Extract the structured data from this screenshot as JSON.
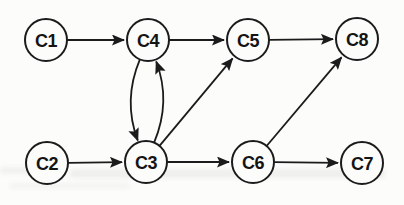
{
  "figure": {
    "background": "#fcfcfb",
    "ink_color": "#1b1b1b",
    "label_color": "#141414",
    "artifact_color": "#e4e4e2"
  },
  "diagram": {
    "node_radius": 21,
    "node_stroke_width": 2,
    "edge_stroke_width": 1.8,
    "nodes": [
      {
        "id": "C1",
        "label": "C1",
        "x": 46,
        "y": 40
      },
      {
        "id": "C4",
        "label": "C4",
        "x": 148,
        "y": 40
      },
      {
        "id": "C5",
        "label": "C5",
        "x": 248,
        "y": 40
      },
      {
        "id": "C8",
        "label": "C8",
        "x": 357,
        "y": 39
      },
      {
        "id": "C2",
        "label": "C2",
        "x": 47,
        "y": 163
      },
      {
        "id": "C3",
        "label": "C3",
        "x": 146,
        "y": 162
      },
      {
        "id": "C6",
        "label": "C6",
        "x": 253,
        "y": 162
      },
      {
        "id": "C7",
        "label": "C7",
        "x": 362,
        "y": 163
      }
    ],
    "edges": [
      {
        "from": "C1",
        "to": "C4",
        "type": "straight"
      },
      {
        "from": "C4",
        "to": "C5",
        "type": "straight"
      },
      {
        "from": "C5",
        "to": "C8",
        "type": "straight"
      },
      {
        "from": "C2",
        "to": "C3",
        "type": "straight"
      },
      {
        "from": "C3",
        "to": "C6",
        "type": "straight"
      },
      {
        "from": "C6",
        "to": "C7",
        "type": "straight"
      },
      {
        "from": "C4",
        "to": "C3",
        "type": "curved",
        "curvature": 0.2
      },
      {
        "from": "C3",
        "to": "C4",
        "type": "curved",
        "curvature": 0.2
      },
      {
        "from": "C3",
        "to": "C5",
        "type": "straight"
      },
      {
        "from": "C6",
        "to": "C8",
        "type": "straight"
      }
    ]
  }
}
